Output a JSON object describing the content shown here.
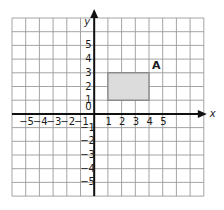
{
  "diagram": {
    "type": "coordinate-grid",
    "axes": {
      "x_label": "x",
      "y_label": "y",
      "origin_label": "0",
      "x_ticks": [
        "-5",
        "-4",
        "-3",
        "-2",
        "-1",
        "1",
        "2",
        "3",
        "4",
        "5"
      ],
      "y_ticks": [
        "5",
        "4",
        "3",
        "2",
        "1",
        "-1",
        "-2",
        "-3",
        "-4",
        "-5"
      ]
    },
    "grid": {
      "columns_left_of_y_axis": 6,
      "columns_right_of_y_axis": 8,
      "rows_above_x_axis": 7,
      "rows_below_x_axis": 6,
      "line_color": "#9a9a9a",
      "axis_color": "#111111"
    },
    "shapes": [
      {
        "name": "rectangle",
        "label": "A",
        "vertices": [
          [
            1,
            1
          ],
          [
            4,
            1
          ],
          [
            4,
            3
          ],
          [
            1,
            3
          ]
        ],
        "fill": "#dcdcdc",
        "stroke": "#8a8a8a"
      }
    ]
  }
}
